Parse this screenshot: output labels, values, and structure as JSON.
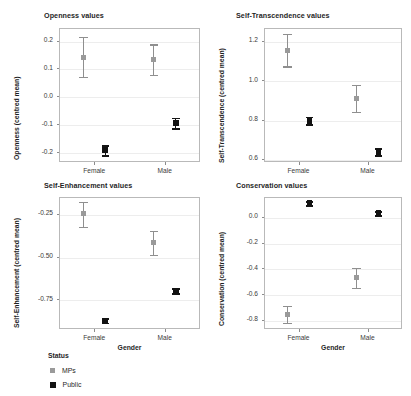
{
  "figure": {
    "xlabel": "Gender",
    "categories": [
      "Female",
      "Male"
    ],
    "legend": {
      "title": "Status",
      "entries": [
        {
          "label": "MPs",
          "color": "#9a9a9a"
        },
        {
          "label": "Public",
          "color": "#121212"
        }
      ]
    }
  },
  "chart_data": [
    {
      "type": "scatter",
      "panel": "top-left",
      "title": "Openness values",
      "xlabel": "",
      "ylabel": "Openness (centred mean)",
      "categories": [
        "Female",
        "Male"
      ],
      "ylim": [
        -0.235,
        0.245
      ],
      "yticks": [
        0.2,
        0.1,
        0.0,
        -0.1,
        -0.2
      ],
      "ytick_labels": [
        "0.2",
        "0.1",
        "0.0",
        "-0.1",
        "-0.2"
      ],
      "grid": true,
      "legend_position": "below-figure",
      "series": [
        {
          "name": "MPs",
          "color": "#9a9a9a",
          "values": [
            0.14,
            0.131
          ],
          "ci_low": [
            0.07,
            0.076
          ],
          "ci_high": [
            0.212,
            0.186
          ]
        },
        {
          "name": "Public",
          "color": "#121212",
          "values": [
            -0.193,
            -0.095
          ],
          "ci_low": [
            -0.211,
            -0.114
          ],
          "ci_high": [
            -0.175,
            -0.077
          ]
        }
      ]
    },
    {
      "type": "scatter",
      "panel": "top-right",
      "title": "Self-Transcendence values",
      "xlabel": "",
      "ylabel": "Self-Transcendence (centred mean)",
      "categories": [
        "Female",
        "Male"
      ],
      "ylim": [
        0.585,
        1.265
      ],
      "yticks": [
        1.2,
        1.0,
        0.8,
        0.6
      ],
      "ytick_labels": [
        "1.2",
        "1.0",
        "0.8",
        "0.6"
      ],
      "grid": true,
      "legend_position": "below-figure",
      "series": [
        {
          "name": "MPs",
          "color": "#9a9a9a",
          "values": [
            1.152,
            0.906
          ],
          "ci_low": [
            1.07,
            0.84
          ],
          "ci_high": [
            1.235,
            0.975
          ]
        },
        {
          "name": "Public",
          "color": "#121212",
          "values": [
            0.795,
            0.636
          ],
          "ci_low": [
            0.778,
            0.619
          ],
          "ci_high": [
            0.814,
            0.655
          ]
        }
      ]
    },
    {
      "type": "scatter",
      "panel": "bottom-left",
      "title": "Self-Enhancement values",
      "xlabel": "Gender",
      "ylabel": "Self-Enhancement (centred mean)",
      "categories": [
        "Female",
        "Male"
      ],
      "ylim": [
        -0.925,
        -0.15
      ],
      "yticks": [
        -0.25,
        -0.5,
        -0.75
      ],
      "ytick_labels": [
        "-0.25",
        "-0.50",
        "-0.75"
      ],
      "grid": true,
      "legend_position": "below-figure",
      "series": [
        {
          "name": "MPs",
          "color": "#9a9a9a",
          "values": [
            -0.245,
            -0.416
          ],
          "ci_low": [
            -0.325,
            -0.49
          ],
          "ci_high": [
            -0.18,
            -0.348
          ]
        },
        {
          "name": "Public",
          "color": "#121212",
          "values": [
            -0.876,
            -0.7
          ],
          "ci_low": [
            -0.888,
            -0.716
          ],
          "ci_high": [
            -0.862,
            -0.684
          ]
        }
      ]
    },
    {
      "type": "scatter",
      "panel": "bottom-right",
      "title": "Conservation values",
      "xlabel": "Gender",
      "ylabel": "Conservation (centred mean)",
      "categories": [
        "Female",
        "Male"
      ],
      "ylim": [
        -0.87,
        0.155
      ],
      "yticks": [
        0.0,
        -0.2,
        -0.4,
        -0.6,
        -0.8
      ],
      "ytick_labels": [
        "0.0",
        "-0.2",
        "-0.4",
        "-0.6",
        "-0.8"
      ],
      "grid": true,
      "legend_position": "below-figure",
      "series": [
        {
          "name": "MPs",
          "color": "#9a9a9a",
          "values": [
            -0.754,
            -0.468
          ],
          "ci_low": [
            -0.826,
            -0.55
          ],
          "ci_high": [
            -0.69,
            -0.396
          ]
        },
        {
          "name": "Public",
          "color": "#121212",
          "values": [
            0.106,
            0.03
          ],
          "ci_low": [
            0.092,
            0.014
          ],
          "ci_high": [
            0.122,
            0.047
          ]
        }
      ]
    }
  ]
}
